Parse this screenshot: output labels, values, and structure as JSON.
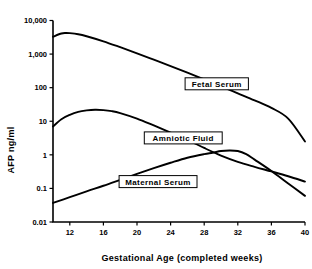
{
  "chart_data": {
    "type": "line",
    "title": "",
    "xlabel": "Gestational Age (completed weeks)",
    "ylabel": "AFP ng/ml",
    "xlim": [
      10,
      40
    ],
    "ylim": [
      0.01,
      10000
    ],
    "yscale": "log",
    "grid": false,
    "legend_position": "inline-boxed-labels",
    "xticks": [
      "12",
      "16",
      "20",
      "24",
      "28",
      "32",
      "36",
      "40"
    ],
    "xtick_values": [
      12,
      16,
      20,
      24,
      28,
      32,
      36,
      40
    ],
    "yticks": [
      "10,000",
      "1,000",
      "100",
      "10",
      "1",
      "0.1",
      "0.01"
    ],
    "ytick_values": [
      10000,
      1000,
      100,
      10,
      1,
      0.1,
      0.01
    ],
    "series": [
      {
        "name": "Fetal Serum",
        "x": [
          10,
          11,
          11.5,
          12,
          13,
          14,
          16,
          18,
          20,
          22,
          24,
          26,
          28,
          30,
          32,
          34,
          36,
          38,
          40
        ],
        "values": [
          3300,
          4100,
          4250,
          4200,
          3900,
          3400,
          2400,
          1600,
          1050,
          680,
          440,
          280,
          175,
          110,
          68,
          42,
          25,
          12,
          2.5
        ]
      },
      {
        "name": "Amniotic Fluid",
        "x": [
          10,
          11,
          12,
          13,
          14,
          15,
          16,
          17,
          18,
          20,
          22,
          24,
          26,
          28,
          30,
          32,
          34,
          36,
          38,
          40
        ],
        "values": [
          7,
          11.5,
          15.5,
          19,
          21,
          22,
          21.5,
          20,
          17.5,
          12,
          7.5,
          4.6,
          2.8,
          1.6,
          0.95,
          0.62,
          0.44,
          0.32,
          0.23,
          0.16
        ]
      },
      {
        "name": "Maternal Serum",
        "x": [
          10,
          12,
          14,
          16,
          18,
          20,
          22,
          24,
          26,
          28,
          29,
          30,
          31,
          32,
          33,
          34,
          36,
          38,
          40
        ],
        "values": [
          0.037,
          0.055,
          0.082,
          0.12,
          0.18,
          0.27,
          0.4,
          0.58,
          0.82,
          1.05,
          1.15,
          1.3,
          1.35,
          1.3,
          1.05,
          0.72,
          0.33,
          0.14,
          0.06
        ]
      }
    ],
    "annotations": [
      {
        "label": "Fetal Serum",
        "x": 29.5,
        "y": 130
      },
      {
        "label": "Amniotic Fluid",
        "x": 25.5,
        "y": 3.2
      },
      {
        "label": "Maternal Serum",
        "x": 22.5,
        "y": 0.16
      }
    ]
  }
}
